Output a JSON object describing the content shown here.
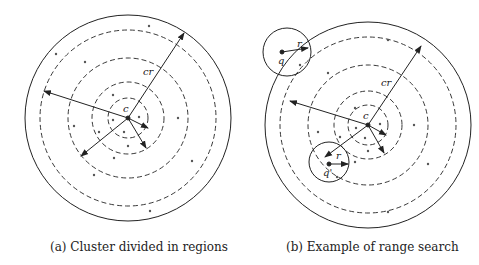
{
  "figure": {
    "panel_a": {
      "caption": "(a) Cluster divided in regions",
      "labels": {
        "center": "c",
        "radius": "cr"
      }
    },
    "panel_b": {
      "caption": "(b) Example of range search",
      "labels": {
        "center": "c",
        "radius": "cr",
        "query1": "q",
        "query1_radius": "r",
        "query2": "q'",
        "query2_radius": "r"
      }
    }
  },
  "colors": {
    "stroke": "#222222",
    "dots": "#555555",
    "background": "#ffffff"
  }
}
